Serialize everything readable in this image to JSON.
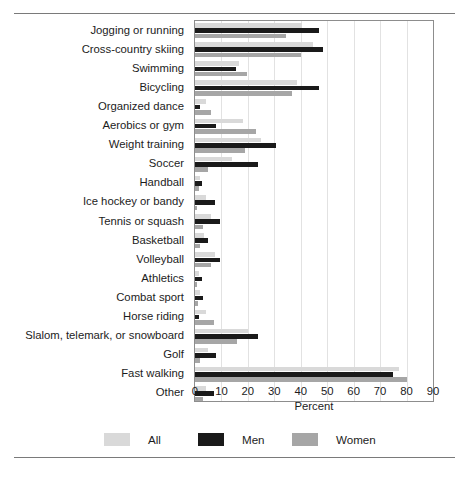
{
  "chart_data": {
    "type": "bar",
    "orientation": "horizontal",
    "title": "",
    "xlabel": "Percent",
    "ylabel": "",
    "xlim": [
      0,
      90
    ],
    "xticks": [
      0,
      10,
      20,
      30,
      40,
      50,
      60,
      70,
      80,
      90
    ],
    "grid": true,
    "legend_position": "bottom",
    "categories": [
      "Jogging or running",
      "Cross-country skiing",
      "Swimming",
      "Bicycling",
      "Organized dance",
      "Aerobics or gym",
      "Weight training",
      "Soccer",
      "Handball",
      "Ice hockey or bandy",
      "Tennis or squash",
      "Basketball",
      "Volleyball",
      "Athletics",
      "Combat sport",
      "Horse riding",
      "Slalom, telemark, or snowboard",
      "Golf",
      "Fast walking",
      "Other"
    ],
    "series": [
      {
        "name": "All",
        "color": "#d9d9d9",
        "values": [
          40.5,
          44.5,
          16.5,
          38.5,
          4.0,
          18.0,
          25.0,
          14.0,
          2.0,
          4.0,
          6.0,
          3.5,
          7.5,
          1.5,
          2.0,
          4.0,
          20.0,
          5.0,
          77.0,
          4.0
        ]
      },
      {
        "name": "Men",
        "color": "#1a1a1a",
        "values": [
          47.0,
          48.5,
          15.5,
          47.0,
          2.0,
          8.0,
          30.5,
          24.0,
          2.5,
          7.5,
          9.5,
          5.0,
          9.5,
          2.5,
          3.0,
          1.5,
          24.0,
          8.0,
          75.0,
          7.0
        ]
      },
      {
        "name": "Women",
        "color": "#a6a6a6",
        "values": [
          34.5,
          40.0,
          19.5,
          36.5,
          6.0,
          23.0,
          19.0,
          5.0,
          1.5,
          0.8,
          3.0,
          2.0,
          6.0,
          0.7,
          1.0,
          7.0,
          16.0,
          2.0,
          80.0,
          3.0
        ]
      }
    ]
  },
  "legend": {
    "items": [
      {
        "label": "All",
        "color": "#d9d9d9"
      },
      {
        "label": "Men",
        "color": "#1a1a1a"
      },
      {
        "label": "Women",
        "color": "#a6a6a6"
      }
    ]
  },
  "axis": {
    "x_label": "Percent"
  }
}
